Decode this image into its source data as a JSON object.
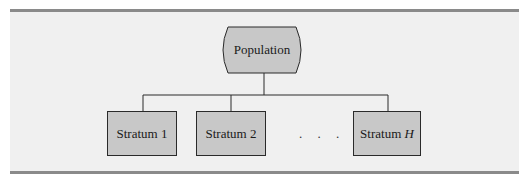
{
  "diagram": {
    "type": "tree",
    "colors": {
      "background": "#f0f0f0",
      "node_fill": "#c8c8c8",
      "stroke": "#2a2a2a",
      "rule": "#8a8a8a"
    },
    "root": {
      "label": "Population",
      "shape": "rounded-bulged"
    },
    "children": [
      {
        "label": "Stratum 1",
        "prefix": "Stratum",
        "suffix": "1",
        "italic_suffix": false
      },
      {
        "label": "Stratum 2",
        "prefix": "Stratum",
        "suffix": "2",
        "italic_suffix": false
      },
      {
        "label": "Stratum H",
        "prefix": "Stratum",
        "suffix": "H",
        "italic_suffix": true
      }
    ],
    "ellipsis": ". . ."
  }
}
